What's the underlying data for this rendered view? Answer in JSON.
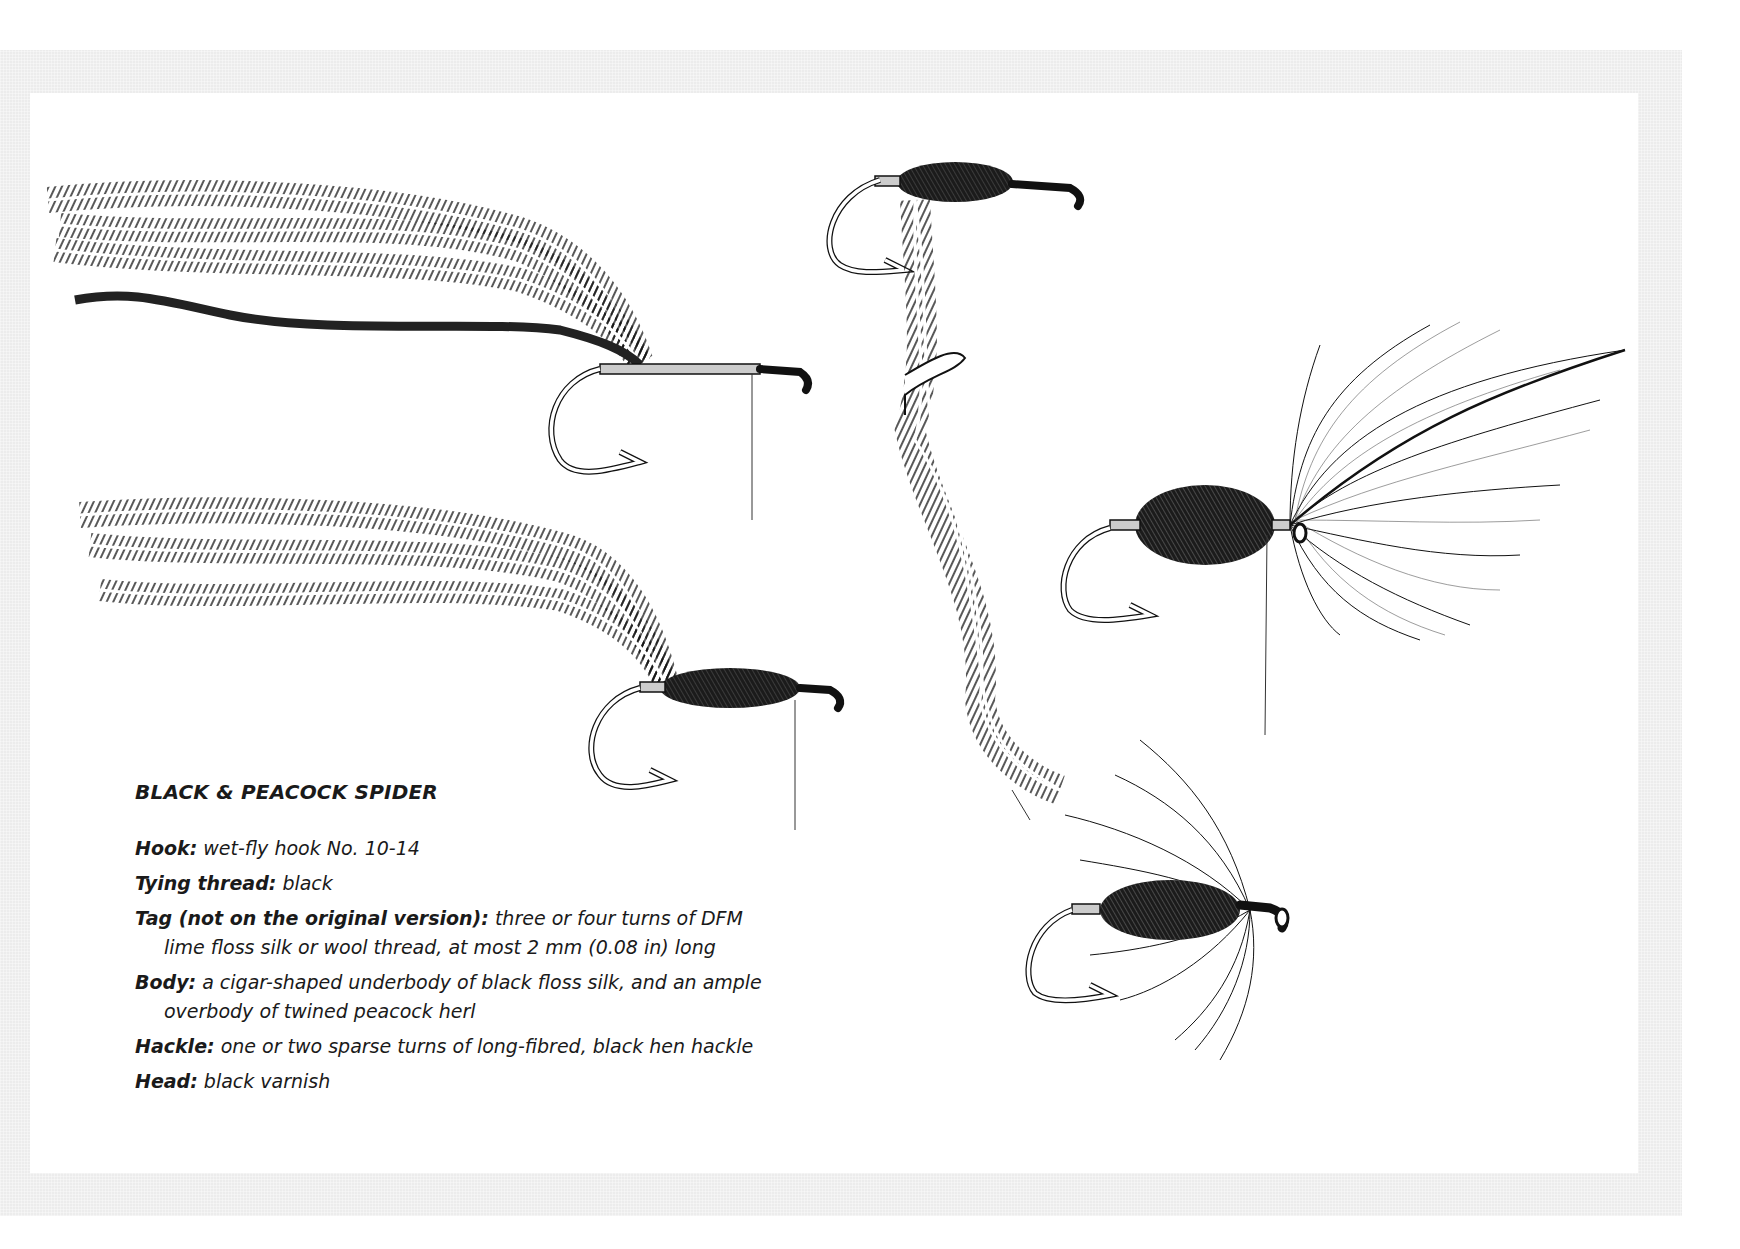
{
  "recipe": {
    "title": "BLACK & PEACOCK SPIDER",
    "specs": [
      {
        "label": "Hook:",
        "value": "wet-fly hook No. 10-14"
      },
      {
        "label": "Tying thread:",
        "value": "black"
      },
      {
        "label": "Tag (not on the original version):",
        "value": "three or four turns of DFM lime floss silk or wool thread, at most 2 mm (0.08 in) long"
      },
      {
        "label": "Body:",
        "value": "a cigar-shaped underbody of black floss silk, and an ample overbody of twined peacock herl"
      },
      {
        "label": "Hackle:",
        "value": "one or two sparse turns of long-fibred, black hen hackle"
      },
      {
        "label": "Head:",
        "value": "black varnish"
      }
    ]
  },
  "illustrations": [
    {
      "id": "step-1",
      "description": "hook with thread base, peacock herls and black floss tied in"
    },
    {
      "id": "step-2",
      "description": "cigar-shaped black floss underbody with herls attached"
    },
    {
      "id": "step-3",
      "description": "herls twined together around tying thread"
    },
    {
      "id": "step-4",
      "description": "finished peacock body with hen hackle feather tied in"
    },
    {
      "id": "step-5",
      "description": "completed Black & Peacock Spider fly"
    }
  ],
  "colors": {
    "frame": "#ececec",
    "page": "#ffffff",
    "ink": "#1a1a1a"
  }
}
